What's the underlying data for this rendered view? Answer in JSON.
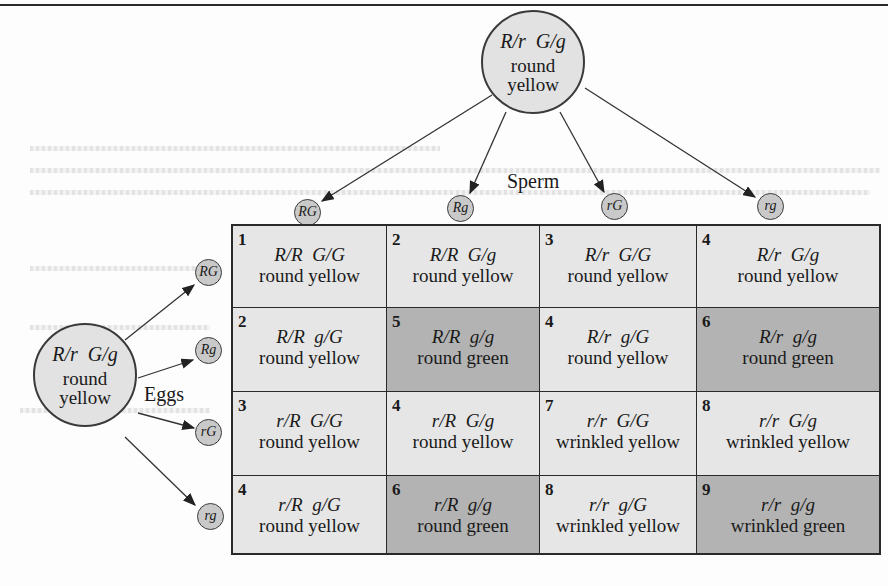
{
  "male_parent": {
    "genotype": "R/r  G/g",
    "phenotype_line1": "round",
    "phenotype_line2": "yellow"
  },
  "female_parent": {
    "genotype": "R/r  G/g",
    "phenotype_line1": "round",
    "phenotype_line2": "yellow"
  },
  "labels": {
    "sperm": "Sperm",
    "eggs": "Eggs"
  },
  "sperm_gametes": [
    "RG",
    "Rg",
    "rG",
    "rg"
  ],
  "egg_gametes": [
    "RG",
    "Rg",
    "rG",
    "rg"
  ],
  "colors": {
    "yellow_cell": "#e6e6e6",
    "green_cell": "#b3b3b3",
    "gamete": "#c9c9c9",
    "parent": "#e2e2e2"
  },
  "grid": [
    [
      {
        "class_num": "1",
        "genotype": "R/R  G/G",
        "phenotype": "round yellow",
        "green": false
      },
      {
        "class_num": "2",
        "genotype": "R/R  G/g",
        "phenotype": "round yellow",
        "green": false
      },
      {
        "class_num": "3",
        "genotype": "R/r  G/G",
        "phenotype": "round yellow",
        "green": false
      },
      {
        "class_num": "4",
        "genotype": "R/r  G/g",
        "phenotype": "round yellow",
        "green": false
      }
    ],
    [
      {
        "class_num": "2",
        "genotype": "R/R  g/G",
        "phenotype": "round yellow",
        "green": false
      },
      {
        "class_num": "5",
        "genotype": "R/R  g/g",
        "phenotype": "round green",
        "green": true
      },
      {
        "class_num": "4",
        "genotype": "R/r  g/G",
        "phenotype": "round yellow",
        "green": false
      },
      {
        "class_num": "6",
        "genotype": "R/r  g/g",
        "phenotype": "round green",
        "green": true
      }
    ],
    [
      {
        "class_num": "3",
        "genotype": "r/R  G/G",
        "phenotype": "round yellow",
        "green": false
      },
      {
        "class_num": "4",
        "genotype": "r/R  G/g",
        "phenotype": "round yellow",
        "green": false
      },
      {
        "class_num": "7",
        "genotype": "r/r  G/G",
        "phenotype": "wrinkled yellow",
        "green": false
      },
      {
        "class_num": "8",
        "genotype": "r/r  G/g",
        "phenotype": "wrinkled yellow",
        "green": false
      }
    ],
    [
      {
        "class_num": "4",
        "genotype": "r/R  g/G",
        "phenotype": "round yellow",
        "green": false
      },
      {
        "class_num": "6",
        "genotype": "r/R  g/g",
        "phenotype": "round green",
        "green": true
      },
      {
        "class_num": "8",
        "genotype": "r/r  g/G",
        "phenotype": "wrinkled yellow",
        "green": false
      },
      {
        "class_num": "9",
        "genotype": "r/r  g/g",
        "phenotype": "wrinkled green",
        "green": true
      }
    ]
  ]
}
